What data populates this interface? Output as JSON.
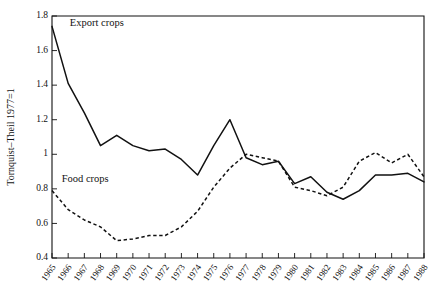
{
  "chart_data": {
    "type": "line",
    "title": "",
    "xlabel": "",
    "ylabel": "Tornquist–Theil 1977=1",
    "xlim": [
      1965,
      1988
    ],
    "ylim": [
      0.4,
      1.8
    ],
    "ytick_step": 0.2,
    "grid": false,
    "legend_position": "inline-annotations",
    "x": [
      1965,
      1966,
      1967,
      1968,
      1969,
      1970,
      1971,
      1972,
      1973,
      1974,
      1975,
      1976,
      1977,
      1978,
      1979,
      1980,
      1981,
      1982,
      1983,
      1984,
      1985,
      1986,
      1987,
      1988
    ],
    "xticklabels": [
      "1965",
      "1966",
      "1967",
      "1968",
      "1969",
      "1970",
      "1971",
      "1972",
      "1973",
      "1974",
      "1975",
      "1976",
      "1977",
      "1978",
      "1979",
      "1980",
      "1981",
      "1982",
      "1983",
      "1984",
      "1985",
      "1986",
      "1987",
      "1988"
    ],
    "yticklabels": [
      "0.4",
      "0.6",
      "0.8",
      "1",
      "1.2",
      "1.4",
      "1.6",
      "1.8"
    ],
    "ytickvalues": [
      0.4,
      0.6,
      0.8,
      1.0,
      1.2,
      1.4,
      1.6,
      1.8
    ],
    "series": [
      {
        "name": "Export crops",
        "style": "solid",
        "label_x": 1966.1,
        "label_y": 1.74,
        "values": [
          1.74,
          1.41,
          1.24,
          1.05,
          1.11,
          1.05,
          1.02,
          1.03,
          0.97,
          0.88,
          1.05,
          1.2,
          0.98,
          0.94,
          0.96,
          0.83,
          0.87,
          0.78,
          0.74,
          0.79,
          0.88,
          0.88,
          0.89,
          0.84
        ]
      },
      {
        "name": "Food crops",
        "style": "dashed",
        "label_x": 1965.6,
        "label_y": 0.84,
        "values": [
          0.79,
          0.68,
          0.62,
          0.58,
          0.5,
          0.51,
          0.53,
          0.53,
          0.58,
          0.67,
          0.81,
          0.92,
          1.0,
          0.98,
          0.96,
          0.81,
          0.79,
          0.76,
          0.81,
          0.96,
          1.01,
          0.95,
          1.0,
          0.87
        ]
      }
    ]
  }
}
